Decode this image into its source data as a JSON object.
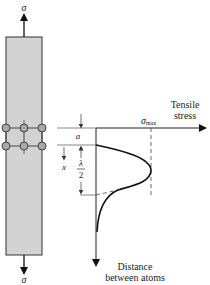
{
  "figure": {
    "bar": {
      "fill_color": "#d3d3d3",
      "border_color": "#333333",
      "atom_color": "#a8a8a8",
      "top_force_label": "σ",
      "bottom_force_label": "σ"
    },
    "graph": {
      "horizontal_axis_label_line1": "Tensile",
      "horizontal_axis_label_line2": "stress",
      "vertical_axis_label_line1": "Distance",
      "vertical_axis_label_line2": "between atoms",
      "sigma_max_symbol": "σ",
      "sigma_max_subscript": "max",
      "gap_label": "a",
      "displacement_label": "x",
      "half_wavelength_numerator": "λ",
      "half_wavelength_denominator": "2"
    }
  }
}
